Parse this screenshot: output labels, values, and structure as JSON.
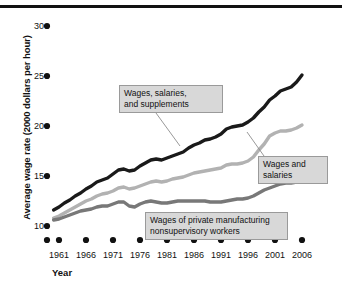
{
  "chart_data": {
    "type": "line",
    "title": "",
    "xlabel": "Year",
    "ylabel": "Average wage rate (2000 dollars per hour)",
    "xlim": [
      1959,
      2007
    ],
    "ylim": [
      9,
      31
    ],
    "yticks": [
      10,
      15,
      20,
      25,
      30
    ],
    "xticks": [
      1961,
      1966,
      1971,
      1976,
      1981,
      1986,
      1991,
      1996,
      2001,
      2006
    ],
    "grid": false,
    "legend_position": "inline-annotations",
    "axis_marker_style": "dots",
    "series": [
      {
        "name": "Wages, salaries, and supplements",
        "color": "#1a1a1a",
        "x": [
          1960,
          1961,
          1962,
          1963,
          1964,
          1965,
          1966,
          1967,
          1968,
          1969,
          1970,
          1971,
          1972,
          1973,
          1974,
          1975,
          1976,
          1977,
          1978,
          1979,
          1980,
          1981,
          1982,
          1983,
          1984,
          1985,
          1986,
          1987,
          1988,
          1989,
          1990,
          1991,
          1992,
          1993,
          1994,
          1995,
          1996,
          1997,
          1998,
          1999,
          2000,
          2001,
          2002,
          2003,
          2004,
          2005,
          2006
        ],
        "values": [
          11.6,
          11.9,
          12.3,
          12.6,
          13.0,
          13.3,
          13.7,
          14.0,
          14.4,
          14.6,
          14.8,
          15.2,
          15.6,
          15.7,
          15.5,
          15.6,
          16.0,
          16.3,
          16.6,
          16.7,
          16.6,
          16.8,
          17.0,
          17.2,
          17.4,
          17.8,
          18.1,
          18.3,
          18.6,
          18.7,
          18.9,
          19.2,
          19.7,
          19.9,
          20.0,
          20.1,
          20.4,
          20.8,
          21.4,
          21.9,
          22.6,
          23.0,
          23.5,
          23.7,
          23.9,
          24.4,
          25.1
        ]
      },
      {
        "name": "Wages and salaries",
        "color": "#b2b2b2",
        "x": [
          1960,
          1961,
          1962,
          1963,
          1964,
          1965,
          1966,
          1967,
          1968,
          1969,
          1970,
          1971,
          1972,
          1973,
          1974,
          1975,
          1976,
          1977,
          1978,
          1979,
          1980,
          1981,
          1982,
          1983,
          1984,
          1985,
          1986,
          1987,
          1988,
          1989,
          1990,
          1991,
          1992,
          1993,
          1994,
          1995,
          1996,
          1997,
          1998,
          1999,
          2000,
          2001,
          2002,
          2003,
          2004,
          2005,
          2006
        ],
        "values": [
          10.8,
          11.0,
          11.3,
          11.6,
          11.9,
          12.2,
          12.5,
          12.7,
          13.0,
          13.2,
          13.3,
          13.5,
          13.8,
          13.9,
          13.7,
          13.8,
          14.0,
          14.2,
          14.4,
          14.5,
          14.4,
          14.5,
          14.7,
          14.8,
          14.9,
          15.1,
          15.3,
          15.4,
          15.5,
          15.6,
          15.7,
          15.8,
          16.1,
          16.2,
          16.2,
          16.3,
          16.5,
          16.9,
          17.6,
          18.2,
          19.0,
          19.3,
          19.5,
          19.5,
          19.6,
          19.8,
          20.1
        ]
      },
      {
        "name": "Wages of private manufacturing nonsupervisory workers",
        "color": "#787878",
        "x": [
          1960,
          1961,
          1962,
          1963,
          1964,
          1965,
          1966,
          1967,
          1968,
          1969,
          1970,
          1971,
          1972,
          1973,
          1974,
          1975,
          1976,
          1977,
          1978,
          1979,
          1980,
          1981,
          1982,
          1983,
          1984,
          1985,
          1986,
          1987,
          1988,
          1989,
          1990,
          1991,
          1992,
          1993,
          1994,
          1995,
          1996,
          1997,
          1998,
          1999,
          2000,
          2001,
          2002,
          2003,
          2004,
          2005,
          2006
        ],
        "values": [
          10.6,
          10.7,
          10.9,
          11.1,
          11.3,
          11.5,
          11.6,
          11.7,
          11.9,
          12.0,
          12.0,
          12.2,
          12.4,
          12.4,
          12.0,
          11.9,
          12.2,
          12.4,
          12.5,
          12.4,
          12.3,
          12.3,
          12.4,
          12.5,
          12.5,
          12.5,
          12.5,
          12.5,
          12.5,
          12.4,
          12.4,
          12.4,
          12.5,
          12.6,
          12.7,
          12.7,
          12.8,
          13.0,
          13.3,
          13.6,
          13.8,
          14.0,
          14.2,
          14.3,
          14.3,
          14.4,
          14.4
        ]
      }
    ],
    "annotations": [
      {
        "id": "wages-salaries-supplements",
        "text": "Wages, salaries,\nand supplements",
        "box": {
          "left": 119,
          "top": 85,
          "width": 94,
          "height": 26
        },
        "leader": {
          "x1": 156,
          "y1": 113,
          "x2": 180,
          "y2": 146
        }
      },
      {
        "id": "wages-and-salaries",
        "text": "Wages and\nsalaries",
        "box": {
          "left": 258,
          "top": 156,
          "width": 60,
          "height": 26
        },
        "leader": {
          "x1": 264,
          "y1": 156,
          "x2": 247,
          "y2": 132
        }
      },
      {
        "id": "wages-private-manufacturing",
        "text": "Wages of private manufacturing\nnonsupervisory workers",
        "box": {
          "left": 145,
          "top": 212,
          "width": 133,
          "height": 26
        },
        "leader": null
      }
    ]
  },
  "axis": {
    "y_title": "Average wage rate (2000 dollars per hour)",
    "x_title": "Year",
    "y_tick_labels": [
      "30",
      "25",
      "20",
      "15",
      "10"
    ],
    "x_tick_labels": [
      "1961",
      "1966",
      "1971",
      "1976",
      "1981",
      "1986",
      "1991",
      "1996",
      "2001",
      "2006"
    ]
  },
  "annotation_text": {
    "a0": "Wages, salaries,\nand supplements",
    "a1": "Wages and\nsalaries",
    "a2": "Wages of private manufacturing\nnonsupervisory workers"
  },
  "colors": {
    "series_dark": "#1a1a1a",
    "series_light_gray": "#b2b2b2",
    "series_mid_gray": "#787878",
    "annotation_fill": "#d8d8d8",
    "annotation_border": "#9a9a9a",
    "rule": "#111111"
  }
}
